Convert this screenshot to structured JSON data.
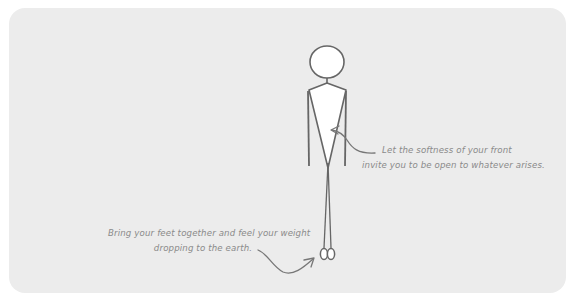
{
  "illustration": {
    "subject": "standing stick figure posture guide",
    "colors": {
      "background": "#ececec",
      "outline": "#6b6b6b",
      "torso_fill": "#ffffff",
      "caption_text": "#8a8a8a"
    }
  },
  "annotations": {
    "front": {
      "line1": "Let the softness of your front",
      "line2": "invite you to be open to whatever arises."
    },
    "feet": {
      "line1": "Bring your feet together and feel your weight",
      "line2": "dropping to the earth."
    }
  }
}
